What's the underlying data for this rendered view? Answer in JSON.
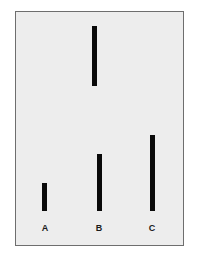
{
  "card": {
    "background": "#ededed",
    "border_color": "#6e6e6e"
  },
  "standard_line": {
    "label": "",
    "length_px": 60,
    "color": "#0a0a0a"
  },
  "comparison_lines": [
    {
      "label": "A",
      "length_px": 28
    },
    {
      "label": "B",
      "length_px": 57
    },
    {
      "label": "C",
      "length_px": 76
    }
  ]
}
